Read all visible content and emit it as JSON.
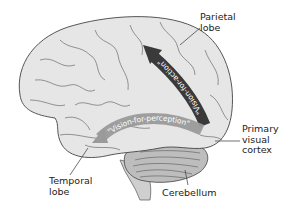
{
  "diagram": {
    "labels": {
      "parietal": [
        "Parietal",
        "lobe"
      ],
      "primary_visual": [
        "Primary",
        "visual",
        "cortex"
      ],
      "temporal": [
        "Temporal",
        "lobe"
      ],
      "cerebellum": "Cerebellum"
    },
    "arrows": {
      "dorsal": {
        "text": "\"Vision-for-action\"",
        "color": "#3a3a3a",
        "text_color": "#ffffff"
      },
      "ventral": {
        "text": "\"Vision-for-perception\"",
        "color": "#9a9a9a",
        "text_color": "#ffffff"
      }
    },
    "colors": {
      "brain_fill": "#e6e6e6",
      "outline": "#444444",
      "background": "#ffffff",
      "cerebellum_fill": "#bdbdbd",
      "stem_fill": "#cfcfcf"
    }
  }
}
